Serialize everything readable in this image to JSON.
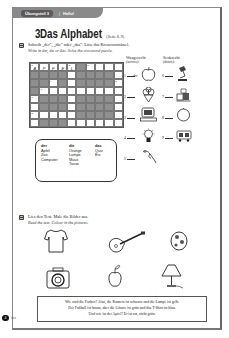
{
  "header": {
    "section_label": "Übungsteil 3",
    "separator": "|",
    "topic": "Hallo!"
  },
  "title": {
    "number": "3",
    "text": "Das Alphabet",
    "pages": "(Seite 8–9)"
  },
  "exercise1": {
    "instruction_de": "Schreib „der“, „die“ oder „das“. Löse das Kreuzworträtsel.",
    "instruction_en": "Write in der, die or das. Solve the crossword puzzle.",
    "crossword": {
      "cols": 10,
      "rows": 8,
      "prefilled": [
        {
          "row": 0,
          "col": 0,
          "num": "1",
          "letter": "A"
        },
        {
          "row": 0,
          "col": 1,
          "letter": "P"
        },
        {
          "row": 0,
          "col": 2,
          "letter": "F"
        },
        {
          "row": 0,
          "col": 3,
          "letter": "E"
        },
        {
          "row": 0,
          "col": 4,
          "num": "2",
          "letter": "L"
        }
      ]
    },
    "word_box": {
      "headers": [
        "der",
        "die",
        "das"
      ],
      "der": [
        "Apfel",
        "Zoo",
        "Computer"
      ],
      "die": [
        "Orange",
        "Lampe",
        "Maus",
        "Tasse"
      ],
      "das": [
        "Quiz",
        "Eis"
      ]
    },
    "across_label": "Waagerecht",
    "across_label_en": "(across):",
    "down_label": "Senkrecht",
    "down_label_en": "(down):",
    "items": [
      {
        "num": "1",
        "answer": "der",
        "picture": "apple"
      },
      {
        "num": "2",
        "answer": "",
        "picture": "ice-cream"
      },
      {
        "num": "3",
        "answer": "",
        "picture": "computer"
      },
      {
        "num": "4",
        "answer": "",
        "picture": "light-bulb"
      },
      {
        "num": "5",
        "answer": "",
        "picture": "mouse"
      },
      {
        "num": "6",
        "answer": "",
        "picture": "lamp"
      },
      {
        "num": "7",
        "answer": "",
        "picture": "cups"
      },
      {
        "num": "8",
        "answer": "",
        "picture": "orange"
      },
      {
        "num": "9",
        "answer": "",
        "picture": "zoo-animals"
      }
    ]
  },
  "exercise2": {
    "instruction_de": "Lies den Text. Male die Bilder aus.",
    "instruction_en": "Read the text. Colour in the pictures.",
    "pictures": [
      "t-shirt",
      "guitar",
      "football",
      "camera",
      "apple",
      "lamp"
    ],
    "text_lines": [
      "Wie sind die Farben? Also, die Kamera ist schwarz und die Lampe ist gelb.",
      "Der Fußball ist braun, aber die Gitarre ist grün und das T-Shirt ist blau.",
      "Und wie ist der Apfel? Er ist rot, nicht grün."
    ]
  },
  "footer": {
    "page_number": "4",
    "word": "vier"
  }
}
